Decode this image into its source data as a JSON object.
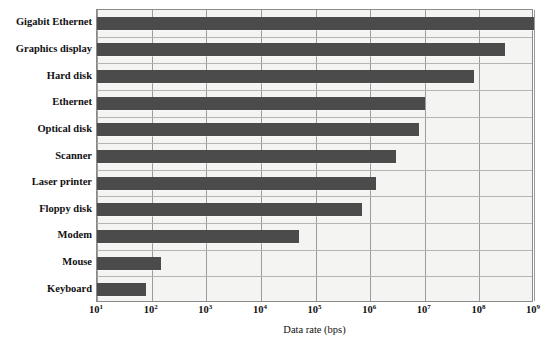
{
  "chart_data": {
    "type": "bar",
    "orientation": "horizontal",
    "title": "",
    "subtitle": "",
    "xlabel": "Data rate (bps)",
    "ylabel": "",
    "xscale": "log",
    "xlim": [
      10,
      1000000000
    ],
    "grid": true,
    "legend": null,
    "legend_position": "none",
    "bar_color": "#4b4b4b",
    "plot_background": "#f4f4f2",
    "grid_color": "#9b9b9b",
    "x_tick_labels": [
      "10",
      "10",
      "10",
      "10",
      "10",
      "10",
      "10",
      "10",
      "10"
    ],
    "x_tick_exponents": [
      "1",
      "2",
      "3",
      "4",
      "5",
      "6",
      "7",
      "8",
      "9"
    ],
    "x_tick_values": [
      10,
      100,
      1000,
      10000,
      100000,
      1000000,
      10000000,
      100000000,
      1000000000
    ],
    "categories": [
      "Gigabit Ethernet",
      "Graphics display",
      "Hard disk",
      "Ethernet",
      "Optical disk",
      "Scanner",
      "Laser printer",
      "Floppy disk",
      "Modem",
      "Mouse",
      "Keyboard"
    ],
    "values": [
      1000000000,
      300000000,
      80000000,
      10000000,
      8000000,
      3000000,
      1300000,
      700000,
      50000,
      150,
      80
    ]
  }
}
